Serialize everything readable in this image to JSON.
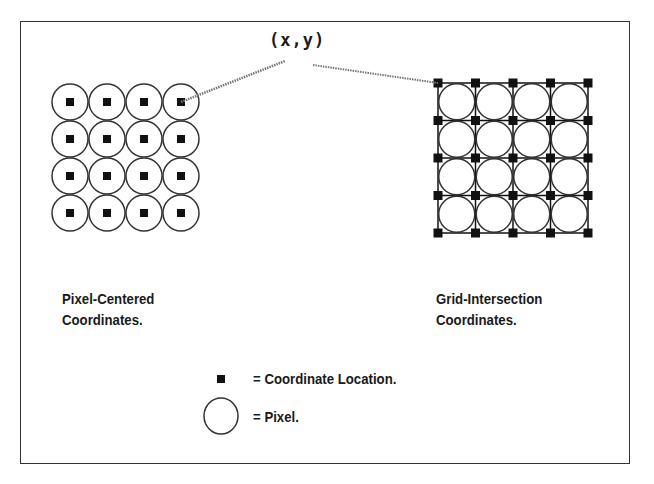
{
  "diagram": {
    "callout_label": "(x,y)",
    "left_panel": {
      "title_line1": "Pixel-Centered",
      "title_line2": "Coordinates.",
      "grid": {
        "rows": 4,
        "cols": 4,
        "origin_x": 70,
        "origin_y": 102,
        "spacing": 37,
        "radius": 18
      }
    },
    "right_panel": {
      "title_line1": "Grid-Intersection",
      "title_line2": "Coordinates.",
      "grid": {
        "rows": 4,
        "cols": 4,
        "origin_x": 438,
        "origin_y": 83,
        "spacing": 37.5,
        "radius": 18
      }
    },
    "legend": {
      "square_label": "= Coordinate Location.",
      "circle_label": "= Pixel."
    },
    "colors": {
      "stroke": "#333333",
      "marker": "#111111",
      "leader": "#777777",
      "background": "#ffffff"
    }
  }
}
